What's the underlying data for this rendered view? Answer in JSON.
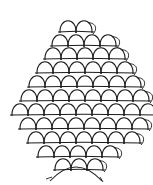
{
  "caption": "",
  "diagram": {
    "stroke_color": "#1a1a1a",
    "background": "#ffffff",
    "arch_width": 16,
    "arch_height": 17,
    "rows": [
      {
        "y": 32,
        "x0": 60,
        "count": 2
      },
      {
        "y": 46,
        "x0": 52,
        "count": 4
      },
      {
        "y": 59,
        "x0": 45,
        "count": 5
      },
      {
        "y": 73,
        "x0": 37,
        "count": 6
      },
      {
        "y": 87,
        "x0": 29,
        "count": 7
      },
      {
        "y": 101,
        "x0": 21,
        "count": 8
      },
      {
        "y": 115,
        "x0": 12,
        "count": 9
      },
      {
        "y": 129,
        "x0": 20,
        "count": 8
      },
      {
        "y": 143,
        "x0": 28,
        "count": 7
      },
      {
        "y": 157,
        "x0": 38,
        "count": 5
      },
      {
        "y": 170,
        "x0": 55,
        "count": 3
      }
    ],
    "bottom_arc": {
      "cx": 76,
      "cy": 181,
      "rx": 26,
      "ry": 14
    }
  }
}
